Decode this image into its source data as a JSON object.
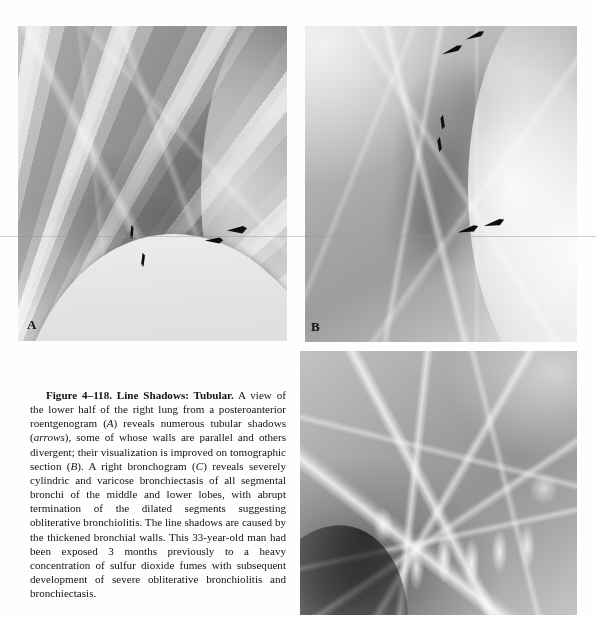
{
  "figure": {
    "number": "Figure 4–118.",
    "title": "Line Shadows: Tubular.",
    "body_part1": " A view of the lower half of the right lung from a posteroanterior roentgenogram (",
    "label_a_ital": "A",
    "body_part2": ") reveals numerous tubular shadows (",
    "arrows_ital": "arrows",
    "body_part3": "), some of whose walls are parallel and others divergent; their visualization is improved on tomographic section (",
    "label_b_ital": "B",
    "body_part4": "). A right bronchogram (",
    "label_c_ital": "C",
    "body_part5": ") reveals severely cylindric and varicose bronchiectasis of all segmental bronchi of the middle and lower lobes, with abrupt termination of the dilated segments suggesting obliterative bronchiolitis. The line shadows are caused by the thickened bronchial walls. This 33-year-old man had been exposed 3 months previously to a heavy concentration of sulfur dioxide fumes with subsequent development of severe obliterative bronchiolitis and bronchiectasis.",
    "full_caption_text": "Figure 4–118. Line Shadows: Tubular. A view of the lower half of the right lung from a posteroanterior roentgenogram (A) reveals numerous tubular shadows (arrows), some of whose walls are parallel and others divergent; their visualization is improved on tomographic section (B). A right bronchogram (C) reveals severely cylindric and varicose bronchiectasis of all segmental bronchi of the middle and lower lobes, with abrupt termination of the dilated segments suggesting obliterative bronchiolitis. The line shadows are caused by the thickened bronchial walls. This 33-year-old man had been exposed 3 months previously to a heavy concentration of sulfur dioxide fumes with subsequent development of severe obliterative bronchiolitis and bronchiectasis."
  },
  "panels": [
    {
      "id": "A",
      "label": "A",
      "caption_role": "posteroanterior roentgenogram of lower half of right lung",
      "arrow_count": 4
    },
    {
      "id": "B",
      "label": "B",
      "caption_role": "tomographic section",
      "arrow_count": 6
    },
    {
      "id": "C",
      "label": "C",
      "caption_role": "right bronchogram",
      "arrow_count": 0
    }
  ],
  "colors": {
    "page_background": "#fefefe",
    "ink": "#111111",
    "panel_label": "#121212",
    "arrow": "#0d0d0d",
    "scanline": "#96969b"
  }
}
